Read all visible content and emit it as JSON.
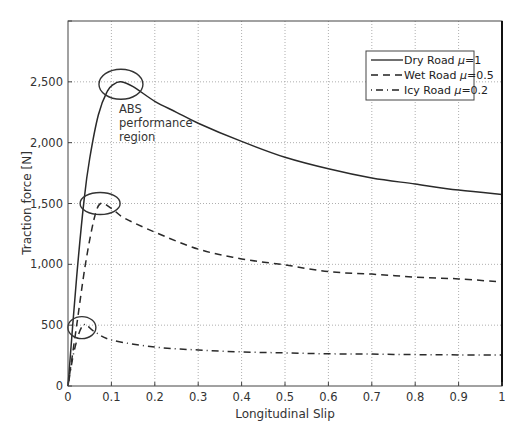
{
  "chart_data": {
    "type": "line",
    "title": "",
    "xlabel": "Longitudinal Slip",
    "ylabel": "Traction force [N]",
    "xlim": [
      0,
      1
    ],
    "ylim": [
      0,
      3000
    ],
    "grid": true,
    "legend_position": "upper right",
    "x_ticks": [
      0,
      0.1,
      0.2,
      0.3,
      0.4,
      0.5,
      0.6,
      0.7,
      0.8,
      0.9,
      1
    ],
    "x_tick_labels": [
      "0",
      "0.1",
      "0.2",
      "0.3",
      "0.4",
      "0.5",
      "0.6",
      "0.7",
      "0.8",
      "0.9",
      "1"
    ],
    "y_ticks": [
      0,
      500,
      1000,
      1500,
      2000,
      2500,
      3000
    ],
    "y_tick_labels": [
      "0",
      "500",
      "1,000",
      "1,500",
      "2,000",
      "2,500",
      ""
    ],
    "series": [
      {
        "name": "Dry Road μ=1",
        "legend_prefix": "Dry Road ",
        "legend_mu": "μ",
        "legend_suffix": "=1",
        "style": "solid",
        "x": [
          0,
          0.02,
          0.037,
          0.05,
          0.07,
          0.09,
          0.105,
          0.122,
          0.15,
          0.2,
          0.25,
          0.3,
          0.4,
          0.5,
          0.6,
          0.7,
          0.8,
          0.9,
          1.0
        ],
        "y": [
          0,
          900,
          1530,
          1870,
          2230,
          2420,
          2480,
          2500,
          2460,
          2340,
          2250,
          2160,
          2010,
          1880,
          1785,
          1710,
          1660,
          1610,
          1575
        ]
      },
      {
        "name": "Wet Road μ=0.5",
        "legend_prefix": "Wet Road ",
        "legend_mu": "μ",
        "legend_suffix": "=0.5",
        "style": "dashed",
        "x": [
          0,
          0.02,
          0.04,
          0.06,
          0.075,
          0.1,
          0.13,
          0.2,
          0.3,
          0.4,
          0.5,
          0.6,
          0.7,
          0.8,
          0.9,
          1.0
        ],
        "y": [
          0,
          500,
          1000,
          1370,
          1500,
          1460,
          1380,
          1265,
          1125,
          1045,
          995,
          940,
          920,
          895,
          880,
          855
        ]
      },
      {
        "name": "Icy Road μ=0.2",
        "legend_prefix": "Icy Road ",
        "legend_mu": "μ",
        "legend_suffix": "=0.2",
        "style": "dashdot",
        "x": [
          0,
          0.015,
          0.035,
          0.06,
          0.1,
          0.2,
          0.3,
          0.4,
          0.5,
          0.6,
          0.7,
          0.8,
          0.9,
          1.0
        ],
        "y": [
          0,
          300,
          500,
          450,
          378,
          320,
          296,
          280,
          272,
          265,
          262,
          258,
          256,
          254
        ]
      }
    ],
    "annotations": [
      {
        "text_lines": [
          "ABS",
          "performance",
          "region"
        ],
        "x": 0.118,
        "y": 2270
      },
      {
        "shape": "ellipse",
        "center_x": 0.122,
        "center_y": 2480,
        "target_series": "Dry Road μ=1"
      },
      {
        "shape": "ellipse",
        "center_x": 0.074,
        "center_y": 1500,
        "target_series": "Wet Road μ=0.5"
      },
      {
        "shape": "ellipse",
        "center_x": 0.032,
        "center_y": 480,
        "target_series": "Icy Road μ=0.2"
      }
    ]
  }
}
